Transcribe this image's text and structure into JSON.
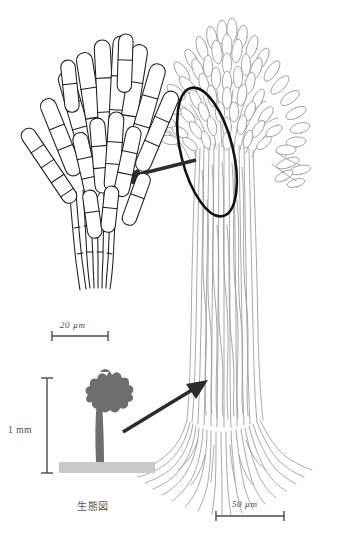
{
  "figure": {
    "background_color": "#ffffff",
    "detail_line_color": "#1d1d1d",
    "main_line_color": "#9a9a9a",
    "habit_fill_color": "#6e6e6e",
    "substrate_color": "#c9c9c9",
    "arrow_color": "#2b2b2b",
    "ellipse_color": "#111111",
    "label_color": "#4a4a4a"
  },
  "scalebars": {
    "detail": {
      "label": "20 µm",
      "value": 20,
      "unit": "µm"
    },
    "main": {
      "label": "50 µm",
      "value": 50,
      "unit": "µm"
    },
    "habit": {
      "label": "1 mm",
      "value": 1,
      "unit": "mm",
      "orientation": "vertical"
    }
  },
  "captions": {
    "habit_diagram": "生態図"
  },
  "panels": {
    "detail": {
      "name": "magnified-conidiophore-detail"
    },
    "main": {
      "name": "whole-synnema-drawing"
    },
    "habit": {
      "name": "habit-silhouette"
    }
  },
  "annotations": {
    "callout_ellipse": {
      "name": "callout-ellipse",
      "cx": 207,
      "cy": 152,
      "rx": 26,
      "ry": 65,
      "rotation": -14
    },
    "detail_arrow": {
      "name": "detail-arrow",
      "from_x": 196,
      "from_y": 160,
      "to_x": 122,
      "to_y": 178
    },
    "habit_arrow": {
      "name": "habit-arrow",
      "from_x": 123,
      "from_y": 432,
      "to_x": 207,
      "to_y": 381
    }
  }
}
